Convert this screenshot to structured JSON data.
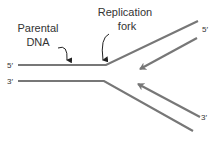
{
  "diagram": {
    "title": "DNA replication fork",
    "labels": {
      "parental_dna_line1": "Parental",
      "parental_dna_line2": "DNA",
      "replication_fork_line1": "Replication",
      "replication_fork_line2": "fork"
    },
    "strand_ends": {
      "upper_left": "5′",
      "lower_left": "3′",
      "upper_right_new": "5′",
      "lower_right_new": "3′"
    },
    "colors": {
      "strand": "#777777",
      "text": "#333333",
      "pointer": "#222222"
    }
  }
}
